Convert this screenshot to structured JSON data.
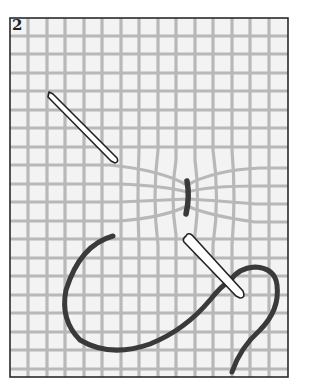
{
  "figure": {
    "number": "2",
    "colors": {
      "background": "#ffffff",
      "frame": "#2a2a2a",
      "canvas_fill": "#f3f3f3",
      "grid_lines": "#b8b8b8",
      "thread": "#3a3a3a",
      "needle_fill": "#ffffff",
      "needle_outline": "#222222"
    }
  }
}
